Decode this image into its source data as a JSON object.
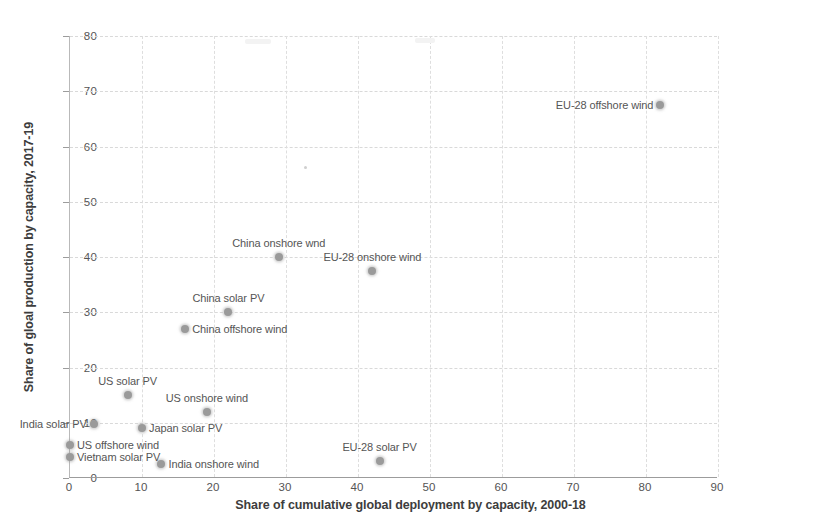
{
  "chart_data": {
    "type": "scatter",
    "title": "",
    "xlabel": "Share of cumulative global deployment by capacity, 2000-18",
    "ylabel": "Share of gloal production by capacity, 2017-19",
    "xlim": [
      0,
      90
    ],
    "ylim": [
      0,
      80
    ],
    "xticks": [
      0,
      10,
      20,
      30,
      40,
      50,
      60,
      70,
      80,
      90
    ],
    "yticks": [
      0,
      10,
      20,
      30,
      40,
      50,
      60,
      70,
      80
    ],
    "grid": true,
    "legend": "none",
    "marker_color": "#9a9a9a",
    "points": [
      {
        "label": "EU-28 offshore wind",
        "x": 82.0,
        "y": 67.5,
        "label_pos": "left"
      },
      {
        "label": "China onshore wnd",
        "x": 29.0,
        "y": 40.0,
        "label_pos": "above"
      },
      {
        "label": "EU-28 onshore wind",
        "x": 42.0,
        "y": 37.5,
        "label_pos": "above"
      },
      {
        "label": "China solar PV",
        "x": 22.0,
        "y": 30.0,
        "label_pos": "above"
      },
      {
        "label": "China offshore wind",
        "x": 16.0,
        "y": 27.0,
        "label_pos": "right"
      },
      {
        "label": "US solar PV",
        "x": 8.0,
        "y": 15.0,
        "label_pos": "above"
      },
      {
        "label": "US onshore wind",
        "x": 19.0,
        "y": 12.0,
        "label_pos": "above"
      },
      {
        "label": "India solar PV",
        "x": 3.3,
        "y": 9.8,
        "label_pos": "left"
      },
      {
        "label": "Japan solar PV",
        "x": 10.0,
        "y": 9.0,
        "label_pos": "right"
      },
      {
        "label": "US offshore wind",
        "x": 0.0,
        "y": 6.0,
        "label_pos": "right"
      },
      {
        "label": "India onshore wind",
        "x": 12.7,
        "y": 2.5,
        "label_pos": "right"
      },
      {
        "label": "Vietnam solar PV",
        "x": 0.0,
        "y": 3.8,
        "label_pos": "right"
      },
      {
        "label": "EU-28 solar PV",
        "x": 43.0,
        "y": 3.0,
        "label_pos": "above"
      }
    ]
  },
  "axes": {
    "x_title": "Share of cumulative global deployment by capacity, 2000-18",
    "y_title": "Share of gloal production by capacity, 2017-19",
    "x_tick_labels": [
      "0",
      "10",
      "20",
      "30",
      "40",
      "50",
      "60",
      "70",
      "80",
      "90"
    ],
    "y_tick_labels": [
      "0",
      "10",
      "20",
      "30",
      "40",
      "50",
      "60",
      "70",
      "80"
    ]
  }
}
